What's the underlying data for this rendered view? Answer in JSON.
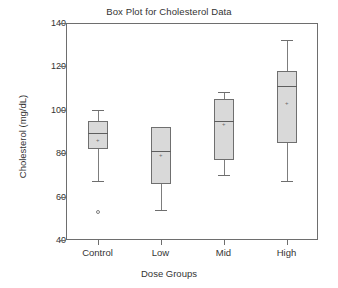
{
  "chart_data": {
    "type": "box",
    "title": "Box Plot for Cholesterol Data",
    "xlabel": "Dose Groups",
    "ylabel": "Cholesterol (mg/dL)",
    "categories": [
      "Control",
      "Low",
      "Mid",
      "High"
    ],
    "ylim": [
      40,
      140
    ],
    "yticks": [
      40,
      60,
      80,
      100,
      120,
      140
    ],
    "ytick_labels": [
      "40",
      "60",
      "80",
      "100",
      "120",
      "140"
    ],
    "grid": false,
    "legend": false,
    "box_fill": "#d9d9d9",
    "box_edge": "#6f6f6f",
    "boxes": [
      {
        "category": "Control",
        "whisker_low": 67,
        "q1": 82,
        "median": 89.5,
        "q3": 95,
        "whisker_high": 100,
        "mean": 86,
        "outliers": [
          53
        ]
      },
      {
        "category": "Low",
        "whisker_low": 54,
        "q1": 66,
        "median": 81,
        "q3": 92,
        "whisker_high": 92,
        "mean": 79,
        "outliers": []
      },
      {
        "category": "Mid",
        "whisker_low": 70,
        "q1": 77,
        "median": 95,
        "q3": 105,
        "whisker_high": 108,
        "mean": 93,
        "outliers": []
      },
      {
        "category": "High",
        "whisker_low": 67,
        "q1": 84.5,
        "median": 111,
        "q3": 118,
        "whisker_high": 132,
        "mean": 103,
        "outliers": []
      }
    ]
  }
}
